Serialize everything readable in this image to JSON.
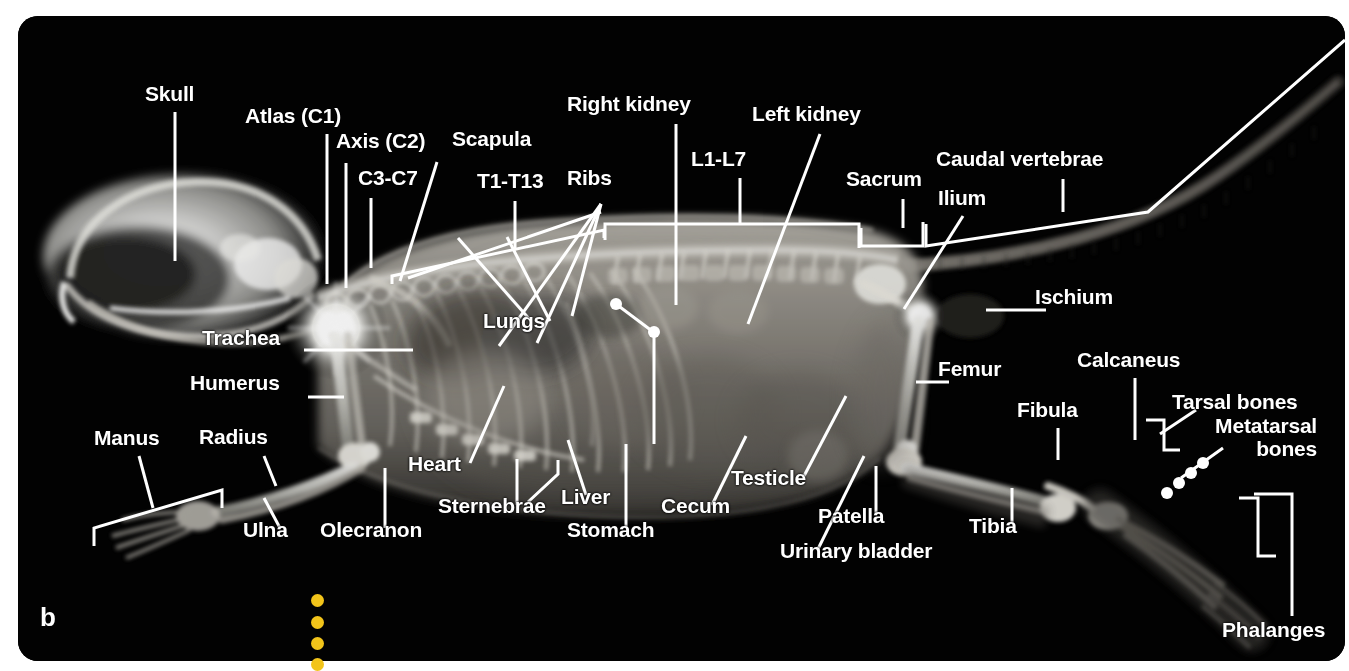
{
  "figure": {
    "panel_letter": "b",
    "panel_background": "#000000",
    "label_color": "#ffffff",
    "marker_color": "#f2c41a",
    "canvas": {
      "width": 1349,
      "height": 671
    }
  },
  "labels": [
    {
      "id": "skull",
      "text": "Skull",
      "x": 145,
      "y": 82,
      "align": "left"
    },
    {
      "id": "atlas-c1",
      "text": "Atlas (C1)",
      "x": 245,
      "y": 104,
      "align": "left"
    },
    {
      "id": "axis-c2",
      "text": "Axis (C2)",
      "x": 336,
      "y": 129,
      "align": "left"
    },
    {
      "id": "c3-c7",
      "text": "C3-C7",
      "x": 358,
      "y": 166,
      "align": "left"
    },
    {
      "id": "scapula",
      "text": "Scapula",
      "x": 452,
      "y": 127,
      "align": "left"
    },
    {
      "id": "t1-t13",
      "text": "T1-T13",
      "x": 477,
      "y": 169,
      "align": "left"
    },
    {
      "id": "ribs",
      "text": "Ribs",
      "x": 567,
      "y": 166,
      "align": "left"
    },
    {
      "id": "right-kidney",
      "text": "Right kidney",
      "x": 567,
      "y": 92,
      "align": "left"
    },
    {
      "id": "left-kidney",
      "text": "Left kidney",
      "x": 752,
      "y": 102,
      "align": "left"
    },
    {
      "id": "l1-l7",
      "text": "L1-L7",
      "x": 691,
      "y": 147,
      "align": "left"
    },
    {
      "id": "sacrum",
      "text": "Sacrum",
      "x": 846,
      "y": 167,
      "align": "left"
    },
    {
      "id": "ilium",
      "text": "Ilium",
      "x": 938,
      "y": 186,
      "align": "left"
    },
    {
      "id": "caudal-vertebrae",
      "text": "Caudal vertebrae",
      "x": 936,
      "y": 147,
      "align": "left"
    },
    {
      "id": "ischium",
      "text": "Ischium",
      "x": 1035,
      "y": 285,
      "align": "left"
    },
    {
      "id": "trachea",
      "text": "Trachea",
      "x": 202,
      "y": 326,
      "align": "left"
    },
    {
      "id": "humerus",
      "text": "Humerus",
      "x": 190,
      "y": 371,
      "align": "left"
    },
    {
      "id": "lungs",
      "text": "Lungs",
      "x": 483,
      "y": 309,
      "align": "left"
    },
    {
      "id": "manus",
      "text": "Manus",
      "x": 94,
      "y": 426,
      "align": "left"
    },
    {
      "id": "radius",
      "text": "Radius",
      "x": 199,
      "y": 425,
      "align": "left"
    },
    {
      "id": "ulna",
      "text": "Ulna",
      "x": 243,
      "y": 518,
      "align": "left"
    },
    {
      "id": "olecranon",
      "text": "Olecranon",
      "x": 320,
      "y": 518,
      "align": "left"
    },
    {
      "id": "heart",
      "text": "Heart",
      "x": 408,
      "y": 452,
      "align": "left"
    },
    {
      "id": "sternebrae",
      "text": "Sternebrae",
      "x": 438,
      "y": 494,
      "align": "left"
    },
    {
      "id": "liver",
      "text": "Liver",
      "x": 561,
      "y": 485,
      "align": "left"
    },
    {
      "id": "stomach",
      "text": "Stomach",
      "x": 567,
      "y": 518,
      "align": "left"
    },
    {
      "id": "cecum",
      "text": "Cecum",
      "x": 661,
      "y": 494,
      "align": "left"
    },
    {
      "id": "testicle",
      "text": "Testicle",
      "x": 731,
      "y": 466,
      "align": "left"
    },
    {
      "id": "urinary-bladder",
      "text": "Urinary bladder",
      "x": 780,
      "y": 539,
      "align": "left"
    },
    {
      "id": "patella",
      "text": "Patella",
      "x": 818,
      "y": 504,
      "align": "left"
    },
    {
      "id": "femur",
      "text": "Femur",
      "x": 938,
      "y": 357,
      "align": "left"
    },
    {
      "id": "fibula",
      "text": "Fibula",
      "x": 1017,
      "y": 398,
      "align": "left"
    },
    {
      "id": "tibia",
      "text": "Tibia",
      "x": 969,
      "y": 514,
      "align": "left"
    },
    {
      "id": "calcaneus",
      "text": "Calcaneus",
      "x": 1077,
      "y": 348,
      "align": "left"
    },
    {
      "id": "tarsal-bones",
      "text": "Tarsal bones",
      "x": 1172,
      "y": 390,
      "align": "left"
    },
    {
      "id": "metatarsal-bones",
      "text": "Metatarsal\nbones",
      "x": 1202,
      "y": 414,
      "align": "left"
    },
    {
      "id": "phalanges",
      "text": "Phalanges",
      "x": 1222,
      "y": 618,
      "align": "left"
    }
  ],
  "markers": {
    "name": "yellow-dot-column",
    "dots": [
      {
        "x": 311,
        "y": 594
      },
      {
        "x": 311,
        "y": 616
      },
      {
        "x": 311,
        "y": 637
      },
      {
        "x": 311,
        "y": 658
      }
    ]
  }
}
